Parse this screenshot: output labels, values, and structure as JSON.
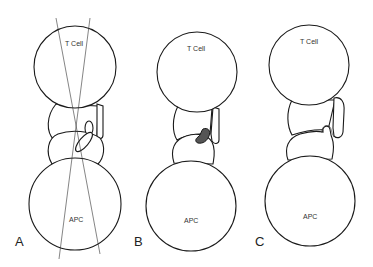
{
  "figure": {
    "panels": [
      {
        "id": "A",
        "label": "A",
        "t_cell": {
          "label": "T Cell",
          "cx": 75,
          "cy": 67,
          "r": 41
        },
        "apc": {
          "label": "APC",
          "cx": 75,
          "cy": 204,
          "r": 46
        },
        "synapse_state": "misaligned with crossing axis lines"
      },
      {
        "id": "B",
        "label": "B",
        "t_cell": {
          "label": "T Cell",
          "cx": 197,
          "cy": 72,
          "r": 40
        },
        "apc": {
          "label": "APC",
          "cx": 191,
          "cy": 206,
          "r": 45
        },
        "synapse_state": "dark bound complex"
      },
      {
        "id": "C",
        "label": "C",
        "t_cell": {
          "label": "T Cell",
          "cx": 309,
          "cy": 65,
          "r": 40
        },
        "apc": {
          "label": "APC",
          "cx": 310,
          "cy": 201,
          "r": 45
        },
        "synapse_state": "membrane knob engaged"
      }
    ],
    "colors": {
      "stroke": "#1a1a1a",
      "complex_fill": "#555555",
      "background": "#ffffff"
    }
  }
}
